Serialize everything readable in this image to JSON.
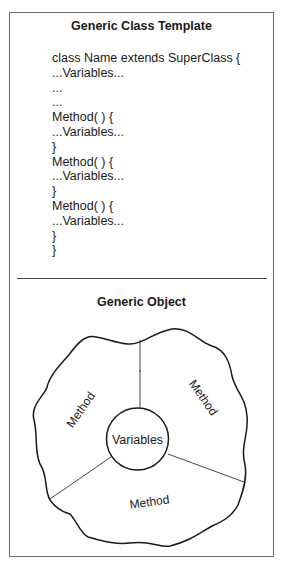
{
  "class_template": {
    "title": "Generic Class Template",
    "lines": [
      "class Name extends SuperClass {",
      "...Variables...",
      "...",
      "...",
      "Method( ) {",
      "...Variables...",
      "}",
      "Method( ) {",
      "...Variables...",
      "}",
      "Method( ) {",
      "...Variables...",
      "}",
      "}"
    ]
  },
  "object_diagram": {
    "title": "Generic Object",
    "center_label": "Variables",
    "segments": [
      {
        "label": "Method",
        "position": "upper-left"
      },
      {
        "label": "Method",
        "position": "upper-right"
      },
      {
        "label": "Method",
        "position": "bottom"
      }
    ]
  }
}
